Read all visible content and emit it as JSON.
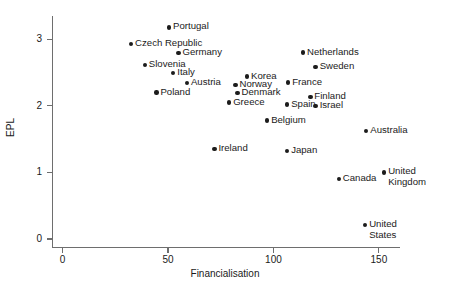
{
  "chart_data": {
    "type": "scatter",
    "title": "",
    "xlabel": "Financialisation",
    "ylabel": "EPL",
    "xlim": [
      -5,
      160
    ],
    "ylim": [
      -0.12,
      3.35
    ],
    "xticks": [
      0,
      50,
      100,
      150
    ],
    "xtick_labels": [
      "0",
      "50",
      "100",
      "150"
    ],
    "yticks": [
      0,
      1,
      2,
      3
    ],
    "ytick_labels": [
      "0",
      "1",
      "2",
      "3"
    ],
    "grid": false,
    "legend": "none",
    "marker_color": "#1c1c1c",
    "axis_color": "#6e6e6e",
    "points": [
      {
        "label": "Portugal",
        "x": 50.5,
        "y": 3.18,
        "label_side": "right"
      },
      {
        "label": "Czech Republic",
        "x": 32.5,
        "y": 2.93,
        "label_side": "right"
      },
      {
        "label": "Germany",
        "x": 55.0,
        "y": 2.79,
        "label_side": "right"
      },
      {
        "label": "Netherlands",
        "x": 114.0,
        "y": 2.8,
        "label_side": "right"
      },
      {
        "label": "Slovenia",
        "x": 39.0,
        "y": 2.61,
        "label_side": "right"
      },
      {
        "label": "Sweden",
        "x": 120.0,
        "y": 2.58,
        "label_side": "right"
      },
      {
        "label": "Italy",
        "x": 52.5,
        "y": 2.49,
        "label_side": "right"
      },
      {
        "label": "Korea",
        "x": 87.5,
        "y": 2.44,
        "label_side": "right"
      },
      {
        "label": "Austria",
        "x": 59.0,
        "y": 2.34,
        "label_side": "right"
      },
      {
        "label": "Norway",
        "x": 82.0,
        "y": 2.31,
        "label_side": "right"
      },
      {
        "label": "France",
        "x": 107.0,
        "y": 2.35,
        "label_side": "right"
      },
      {
        "label": "Denmark",
        "x": 83.0,
        "y": 2.19,
        "label_side": "right"
      },
      {
        "label": "Poland",
        "x": 44.5,
        "y": 2.2,
        "label_side": "right"
      },
      {
        "label": "Finland",
        "x": 117.5,
        "y": 2.13,
        "label_side": "right"
      },
      {
        "label": "Greece",
        "x": 79.0,
        "y": 2.05,
        "label_side": "right"
      },
      {
        "label": "Spain",
        "x": 106.5,
        "y": 2.02,
        "label_side": "right"
      },
      {
        "label": "Israel",
        "x": 120.0,
        "y": 2.0,
        "label_side": "right"
      },
      {
        "label": "Belgium",
        "x": 97.0,
        "y": 1.78,
        "label_side": "right"
      },
      {
        "label": "Australia",
        "x": 144.0,
        "y": 1.62,
        "label_side": "right"
      },
      {
        "label": "Ireland",
        "x": 72.0,
        "y": 1.35,
        "label_side": "right"
      },
      {
        "label": "Japan",
        "x": 106.5,
        "y": 1.32,
        "label_side": "right"
      },
      {
        "label": "United\nKingdom",
        "x": 152.5,
        "y": 1.0,
        "label_side": "right"
      },
      {
        "label": "Canada",
        "x": 131.0,
        "y": 0.9,
        "label_side": "right"
      },
      {
        "label": "United\nStates",
        "x": 143.5,
        "y": 0.21,
        "label_side": "right"
      }
    ]
  }
}
